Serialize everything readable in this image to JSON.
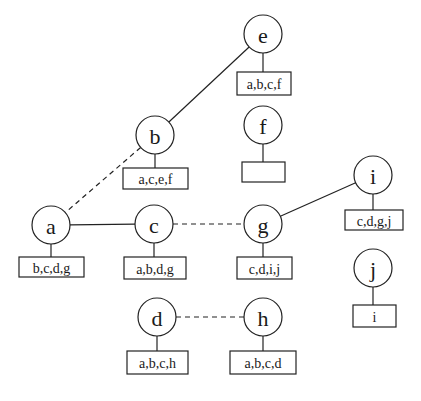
{
  "diagram": {
    "node_radius": 19,
    "nodes": [
      {
        "id": "e",
        "label": "e",
        "cx": 263,
        "cy": 34,
        "box": {
          "text": "a,b,c,f",
          "x": 237,
          "y": 72,
          "w": 54,
          "h": 23
        }
      },
      {
        "id": "b",
        "label": "b",
        "cx": 155,
        "cy": 135,
        "box": {
          "text": "a,c,e,f",
          "x": 123,
          "y": 168,
          "w": 65,
          "h": 21
        }
      },
      {
        "id": "f",
        "label": "f",
        "cx": 263,
        "cy": 125,
        "box": {
          "text": "",
          "x": 242,
          "y": 162,
          "w": 43,
          "h": 20
        }
      },
      {
        "id": "i",
        "label": "i",
        "cx": 373,
        "cy": 175,
        "box": {
          "text": "c,d,g,j",
          "x": 345,
          "y": 210,
          "w": 58,
          "h": 20
        }
      },
      {
        "id": "a",
        "label": "a",
        "cx": 51,
        "cy": 225,
        "box": {
          "text": "b,c,d,g",
          "x": 19,
          "y": 257,
          "w": 65,
          "h": 20
        }
      },
      {
        "id": "c",
        "label": "c",
        "cx": 154,
        "cy": 224,
        "box": {
          "text": "a,b,d,g",
          "x": 124,
          "y": 257,
          "w": 62,
          "h": 22
        }
      },
      {
        "id": "g",
        "label": "g",
        "cx": 263,
        "cy": 224,
        "box": {
          "text": "c,d,i,j",
          "x": 237,
          "y": 257,
          "w": 55,
          "h": 22
        }
      },
      {
        "id": "j",
        "label": "j",
        "cx": 373,
        "cy": 268,
        "box": {
          "text": "i",
          "x": 353,
          "y": 305,
          "w": 43,
          "h": 22
        }
      },
      {
        "id": "d",
        "label": "d",
        "cx": 157,
        "cy": 317,
        "box": {
          "text": "a,b,c,h",
          "x": 127,
          "y": 351,
          "w": 61,
          "h": 23
        }
      },
      {
        "id": "h",
        "label": "h",
        "cx": 263,
        "cy": 317,
        "box": {
          "text": "a,b,c,d",
          "x": 230,
          "y": 351,
          "w": 66,
          "h": 23
        }
      }
    ],
    "edges": [
      {
        "from": "e",
        "to": "b",
        "style": "solid"
      },
      {
        "from": "b",
        "to": "a",
        "style": "dashed"
      },
      {
        "from": "a",
        "to": "c",
        "style": "solid"
      },
      {
        "from": "c",
        "to": "g",
        "style": "dashed"
      },
      {
        "from": "g",
        "to": "i",
        "style": "solid"
      },
      {
        "from": "d",
        "to": "h",
        "style": "dashed"
      }
    ]
  }
}
